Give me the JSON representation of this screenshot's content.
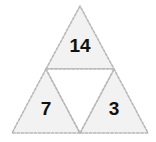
{
  "figure": {
    "name": "subdivided-triangle-puzzle",
    "background_color": "#ffffff",
    "fill_color": "#f2f2f2",
    "edge_color": "#b8b8b8",
    "edge_style": "dashed",
    "label_color": "#111111",
    "outer_triangle": {
      "apex": [
        80,
        6
      ],
      "bottom_left": [
        12,
        133
      ],
      "bottom_right": [
        148,
        133
      ]
    },
    "midpoints": {
      "left_edge": [
        46,
        69
      ],
      "right_edge": [
        114,
        69
      ],
      "base": [
        80,
        133
      ]
    },
    "cells": [
      {
        "id": "top",
        "name": "top-triangle",
        "value": "14",
        "filled": true,
        "label_x": 80,
        "label_y": 47,
        "font_size": 19,
        "points": "80,6 46,69 114,69"
      },
      {
        "id": "bottom-left",
        "name": "bottom-left-triangle",
        "value": "7",
        "filled": true,
        "label_x": 46,
        "label_y": 110,
        "font_size": 19,
        "points": "46,69 12,133 80,133"
      },
      {
        "id": "bottom-right",
        "name": "bottom-right-triangle",
        "value": "3",
        "filled": true,
        "label_x": 114,
        "label_y": 110,
        "font_size": 19,
        "points": "114,69 80,133 148,133"
      },
      {
        "id": "center",
        "name": "center-inverted-triangle",
        "value": "",
        "filled": false,
        "label_x": 80,
        "label_y": 100,
        "font_size": 19,
        "points": "46,69 114,69 80,133"
      }
    ]
  }
}
